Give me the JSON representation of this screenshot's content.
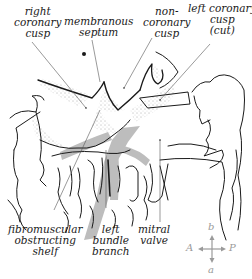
{
  "diagram": {
    "labels": {
      "right_coronary_cusp": [
        "right",
        "coronary",
        "cusp"
      ],
      "membranous_septum": [
        "membranous",
        "septum"
      ],
      "non_coronary_cusp": [
        "non-",
        "coronary",
        "cusp"
      ],
      "left_coronary_cusp": [
        "left coronary",
        "cusp",
        "(cut)"
      ],
      "fibromuscular_shelf": [
        "fibromuscular",
        "obstructing",
        "shelf"
      ],
      "left_bundle_branch": [
        "left",
        "bundle",
        "branch"
      ],
      "mitral_valve": [
        "mitral",
        "valve"
      ]
    },
    "compass": {
      "up": "b",
      "down": "a",
      "left": "A",
      "right": "P"
    },
    "colors": {
      "ink": "#1a1a1a",
      "flow_arrow": "#bdbdbd",
      "stipple": "#555555",
      "compass": "#9a9a9a"
    }
  }
}
